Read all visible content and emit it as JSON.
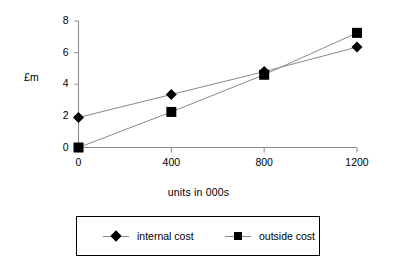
{
  "chart_data": {
    "type": "line",
    "title": "",
    "xlabel": "units in 000s",
    "ylabel": "£m",
    "x": [
      0,
      400,
      800,
      1200
    ],
    "xtick_labels": [
      "0",
      "400",
      "800",
      "1200"
    ],
    "ytick_labels": [
      "0",
      "2",
      "4",
      "6",
      "8"
    ],
    "yticks": [
      0,
      2,
      4,
      6,
      8
    ],
    "xlim": [
      0,
      1200
    ],
    "ylim": [
      0,
      8
    ],
    "grid": false,
    "legend_position": "bottom",
    "series": [
      {
        "name": "internal cost",
        "marker": "diamond",
        "values": [
          1.9,
          3.35,
          4.8,
          6.35
        ]
      },
      {
        "name": "outside cost",
        "marker": "square",
        "values": [
          0.0,
          2.25,
          4.6,
          7.25
        ]
      }
    ]
  },
  "legend": {
    "entries": [
      {
        "label": "internal cost",
        "marker": "diamond"
      },
      {
        "label": "outside cost",
        "marker": "square"
      }
    ]
  },
  "colors": {
    "marker": "#000000",
    "line": "#8a8a8a",
    "axis": "#8a8a8a",
    "text": "#000000",
    "background": "#ffffff"
  }
}
